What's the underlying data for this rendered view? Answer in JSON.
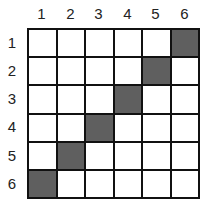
{
  "columns": [
    "1",
    "2",
    "3",
    "4",
    "5",
    "6"
  ],
  "rows": [
    "1",
    "2",
    "3",
    "4",
    "5",
    "6"
  ],
  "filled_color": "#5f5f5f",
  "filled_cells": [
    [
      1,
      6
    ],
    [
      2,
      5
    ],
    [
      3,
      4
    ],
    [
      4,
      3
    ],
    [
      5,
      2
    ],
    [
      6,
      1
    ]
  ]
}
